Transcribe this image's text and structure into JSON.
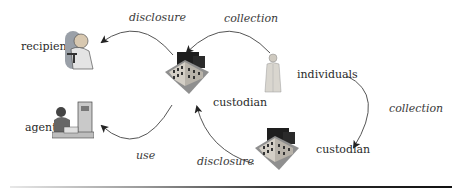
{
  "diagram": {
    "nodes": {
      "recipient": {
        "label": "recipient",
        "icon": "recipient-person-icon"
      },
      "agent": {
        "label": "agent",
        "icon": "agent-at-desk-icon"
      },
      "custodian_top": {
        "label": "custodian",
        "icon": "building-icon"
      },
      "custodian_bottom": {
        "label": "custodian",
        "icon": "building-icon"
      },
      "individuals": {
        "label": "individuals",
        "icon": "person-in-coat-icon"
      }
    },
    "edges": [
      {
        "from": "custodian_top",
        "to": "recipient",
        "label": "disclosure"
      },
      {
        "from": "individuals",
        "to": "custodian_top",
        "label": "collection"
      },
      {
        "from": "custodian_top",
        "to": "agent",
        "label": "use"
      },
      {
        "from": "custodian_bottom",
        "to": "custodian_top",
        "label": "disclosure"
      },
      {
        "from": "individuals",
        "to": "custodian_bottom",
        "label": "collection"
      }
    ]
  }
}
